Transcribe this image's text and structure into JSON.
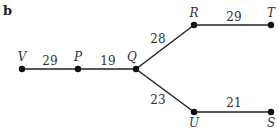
{
  "part_label": "b",
  "nodes": {
    "V": {
      "label": "V",
      "x": 22,
      "y": 69
    },
    "P": {
      "label": "P",
      "x": 78,
      "y": 69
    },
    "Q": {
      "label": "Q",
      "x": 136,
      "y": 69
    },
    "R": {
      "label": "R",
      "x": 194,
      "y": 25
    },
    "T": {
      "label": "T",
      "x": 271,
      "y": 25
    },
    "U": {
      "label": "U",
      "x": 194,
      "y": 112
    },
    "S": {
      "label": "S",
      "x": 271,
      "y": 112
    }
  },
  "edges": [
    {
      "from": "V",
      "to": "P",
      "weight": "29"
    },
    {
      "from": "P",
      "to": "Q",
      "weight": "19"
    },
    {
      "from": "Q",
      "to": "R",
      "weight": "28"
    },
    {
      "from": "R",
      "to": "T",
      "weight": "29"
    },
    {
      "from": "Q",
      "to": "U",
      "weight": "23"
    },
    {
      "from": "U",
      "to": "S",
      "weight": "21"
    }
  ]
}
